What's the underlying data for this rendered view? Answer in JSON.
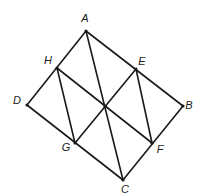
{
  "diagram": {
    "type": "geometry-figure",
    "points": [
      {
        "id": "A",
        "label": "A",
        "x": 86,
        "y": 31,
        "lx": 85,
        "ly": 19
      },
      {
        "id": "B",
        "label": "B",
        "x": 183,
        "y": 106,
        "lx": 189,
        "ly": 106
      },
      {
        "id": "C",
        "label": "C",
        "x": 123,
        "y": 180,
        "lx": 125,
        "ly": 190
      },
      {
        "id": "D",
        "label": "D",
        "x": 27,
        "y": 105,
        "lx": 17,
        "ly": 101
      },
      {
        "id": "E",
        "label": "E",
        "x": 136,
        "y": 69,
        "lx": 142,
        "ly": 62
      },
      {
        "id": "F",
        "label": "F",
        "x": 152,
        "y": 143,
        "lx": 160,
        "ly": 150
      },
      {
        "id": "G",
        "label": "G",
        "x": 75,
        "y": 143,
        "lx": 66,
        "ly": 148
      },
      {
        "id": "H",
        "label": "H",
        "x": 57,
        "y": 68,
        "lx": 48,
        "ly": 61
      },
      {
        "id": "O",
        "label": "",
        "x": 105,
        "y": 106,
        "lx": 0,
        "ly": 0
      }
    ],
    "segments": [
      [
        "A",
        "B"
      ],
      [
        "B",
        "C"
      ],
      [
        "C",
        "D"
      ],
      [
        "D",
        "A"
      ],
      [
        "H",
        "F"
      ],
      [
        "E",
        "G"
      ],
      [
        "A",
        "C"
      ],
      [
        "H",
        "G"
      ],
      [
        "E",
        "F"
      ]
    ],
    "colors": {
      "stroke": "#1a1a1a",
      "label": "#222222",
      "background": "#ffffff"
    }
  }
}
